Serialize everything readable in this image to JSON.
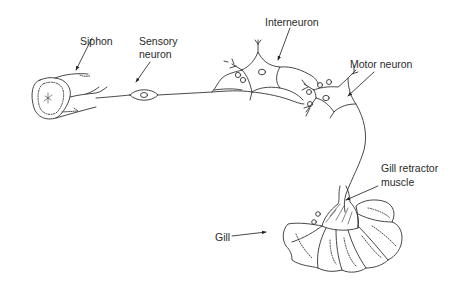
{
  "diagram": {
    "labels": {
      "siphon": "Siphon",
      "sensory_neuron_line1": "Sensory",
      "sensory_neuron_line2": "neuron",
      "interneuron": "Interneuron",
      "motor_neuron": "Motor neuron",
      "gill_retractor_line1": "Gill retractor",
      "gill_retractor_line2": "muscle",
      "gill": "Gill"
    },
    "colors": {
      "stroke": "#333333",
      "text": "#2a2a2a",
      "background": "#ffffff"
    }
  }
}
